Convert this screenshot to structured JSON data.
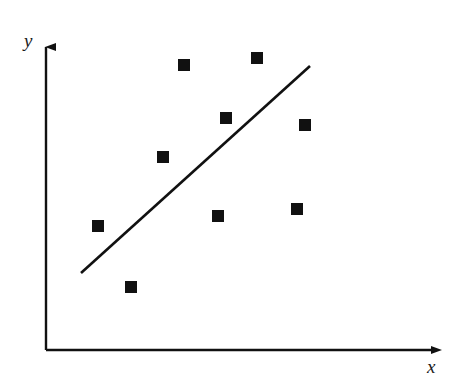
{
  "figure": {
    "width": 463,
    "height": 391,
    "background": "#ffffff",
    "ink_color": "#111111"
  },
  "axes": {
    "x_axis": {
      "label": "x",
      "label_position": {
        "x": 427,
        "y": 357
      },
      "start": {
        "x": 46,
        "y": 350
      },
      "end": {
        "x": 443,
        "y": 350
      },
      "arrow": "right"
    },
    "y_axis": {
      "label": "y",
      "label_position": {
        "x": 24,
        "y": 31
      },
      "start": {
        "x": 46,
        "y": 350
      },
      "end": {
        "x": 46,
        "y": 36
      },
      "arrow": "up"
    }
  },
  "chart_data": {
    "type": "scatter",
    "title": "",
    "subtitle": "",
    "xlabel": "x",
    "ylabel": "y",
    "grid": false,
    "legend": "none",
    "axis_ticks": "none",
    "xlim": [
      0,
      10
    ],
    "ylim": [
      0,
      10
    ],
    "marker": {
      "shape": "square",
      "size_px": 12,
      "color": "#111111"
    },
    "points_pixels": [
      {
        "x": 98,
        "y": 226
      },
      {
        "x": 131,
        "y": 287
      },
      {
        "x": 163,
        "y": 157
      },
      {
        "x": 184,
        "y": 65
      },
      {
        "x": 218,
        "y": 216
      },
      {
        "x": 226,
        "y": 118
      },
      {
        "x": 257,
        "y": 58
      },
      {
        "x": 297,
        "y": 209
      },
      {
        "x": 305,
        "y": 125
      }
    ],
    "points": [
      {
        "x": 1.3,
        "y": 3.9
      },
      {
        "x": 2.1,
        "y": 2.0
      },
      {
        "x": 2.9,
        "y": 6.1
      },
      {
        "x": 3.5,
        "y": 9.1
      },
      {
        "x": 4.3,
        "y": 4.3
      },
      {
        "x": 4.5,
        "y": 7.4
      },
      {
        "x": 5.3,
        "y": 9.3
      },
      {
        "x": 6.3,
        "y": 4.5
      },
      {
        "x": 6.5,
        "y": 7.2
      }
    ],
    "series": [
      {
        "name": "observations",
        "type": "scatter",
        "values": [
          {
            "x": 1.3,
            "y": 3.9
          },
          {
            "x": 2.1,
            "y": 2.0
          },
          {
            "x": 2.9,
            "y": 6.1
          },
          {
            "x": 3.5,
            "y": 9.1
          },
          {
            "x": 4.3,
            "y": 4.3
          },
          {
            "x": 4.5,
            "y": 7.4
          },
          {
            "x": 5.3,
            "y": 9.3
          },
          {
            "x": 6.3,
            "y": 4.5
          },
          {
            "x": 6.5,
            "y": 7.2
          }
        ]
      },
      {
        "name": "regression-line",
        "type": "line",
        "start_pixel": {
          "x": 81,
          "y": 273
        },
        "end_pixel": {
          "x": 310,
          "y": 66
        },
        "start": {
          "x": 0.9,
          "y": 2.5
        },
        "end": {
          "x": 6.7,
          "y": 9.1
        },
        "slope_pixels": -0.904,
        "stroke_width": 2.6,
        "color": "#111111"
      }
    ],
    "annotations": []
  }
}
